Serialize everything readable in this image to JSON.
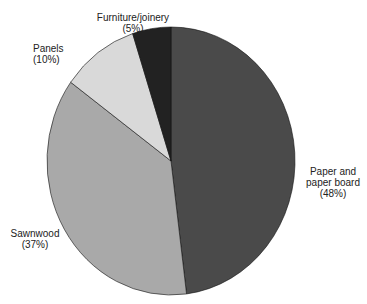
{
  "chart_data": {
    "type": "pie",
    "title": "",
    "slices": [
      {
        "label": "Paper and paper board",
        "value": 48,
        "color": "#4a4a4a"
      },
      {
        "label": "Sawnwood",
        "value": 37,
        "color": "#a9a9a9"
      },
      {
        "label": "Panels",
        "value": 10,
        "color": "#d9d9d9"
      },
      {
        "label": "Furniture/joinery",
        "value": 5,
        "color": "#222222"
      }
    ]
  },
  "labels": {
    "paper_line1": "Paper and",
    "paper_line2": "paper board",
    "paper_pct": "(48%)",
    "sawnwood": "Sawnwood",
    "sawnwood_pct": "(37%)",
    "panels": "Panels (10%)",
    "furniture": "Furniture/joinery",
    "furniture_pct": "(5%)"
  }
}
